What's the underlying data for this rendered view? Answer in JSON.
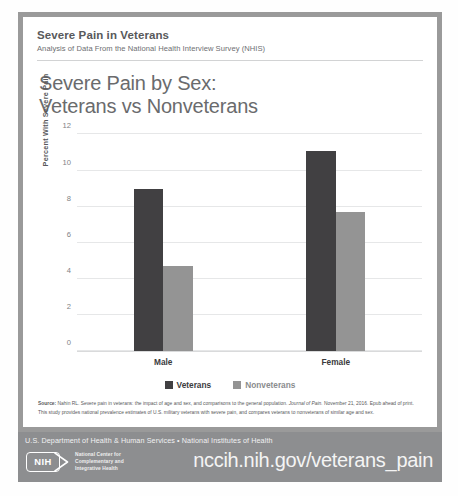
{
  "header": {
    "title": "Severe Pain in Veterans",
    "subtitle": "Analysis of Data From the National Health Interview Survey (NHIS)"
  },
  "main_title_line1": "Severe Pain by Sex:",
  "main_title_line2": "Veterans vs Nonveterans",
  "chart_data": {
    "type": "bar",
    "title": "Severe Pain by Sex: Veterans vs Nonveterans",
    "xlabel": "",
    "ylabel": "Percent With Severe Pain",
    "categories": [
      "Male",
      "Female"
    ],
    "series": [
      {
        "name": "Veterans",
        "color": "#414042",
        "values": [
          9.0,
          11.1
        ]
      },
      {
        "name": "Nonveterans",
        "color": "#949494",
        "values": [
          4.7,
          7.7
        ]
      }
    ],
    "ylim": [
      0,
      12
    ],
    "yticks": [
      0,
      2,
      4,
      6,
      8,
      10,
      12
    ],
    "ytick_labels": [
      "0",
      "2",
      "4",
      "6",
      "8",
      "10",
      "12"
    ],
    "grid": true,
    "legend_position": "bottom"
  },
  "source": {
    "label": "Source:",
    "line1_a": " Nahin RL. Severe pain in veterans: the impact of age and sex, and comparisons to the general population. ",
    "line1_italic": "Journal of Pain.",
    "line1_b": " November 21, 2016. Epub ahead of print.",
    "line2": "This study provides national prevalence estimates of U.S. military veterans with severe pain, and compares veterans to nonveterans of similar age and sex."
  },
  "footer": {
    "agency": "U.S. Department of Health & Human Services • National Institutes of Health",
    "nih_logo_text": "NIH",
    "center_name_line1": "National Center for",
    "center_name_line2": "Complementary and",
    "center_name_line3": "Integrative Health",
    "url": "nccih.nih.gov/veterans_pain"
  }
}
